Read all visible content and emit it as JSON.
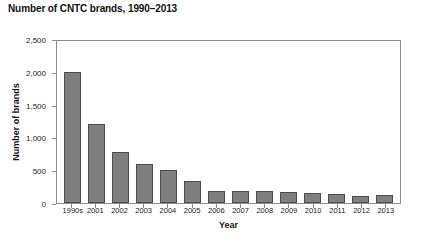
{
  "chart_data": {
    "type": "bar",
    "title": "Number of CNTC brands, 1990–2013",
    "xlabel": "Year",
    "ylabel": "Number of brands",
    "categories": [
      "1990s",
      "2001",
      "2002",
      "2003",
      "2004",
      "2005",
      "2006",
      "2007",
      "2008",
      "2009",
      "2010",
      "2011",
      "2012",
      "2013"
    ],
    "values": [
      2000,
      1200,
      780,
      600,
      500,
      340,
      190,
      190,
      180,
      175,
      150,
      145,
      110,
      125
    ],
    "ylim": [
      0,
      2500
    ],
    "ytick_labels": [
      "0",
      "500",
      "1,000",
      "1,500",
      "2,000",
      "2,500"
    ],
    "ytick_values": [
      0,
      500,
      1000,
      1500,
      2000,
      2500
    ],
    "grid": false,
    "legend": null,
    "series_color": "#7f7f7f",
    "bar_edge_color": "#4d4d4d",
    "axis_color": "#8c8c8c"
  }
}
